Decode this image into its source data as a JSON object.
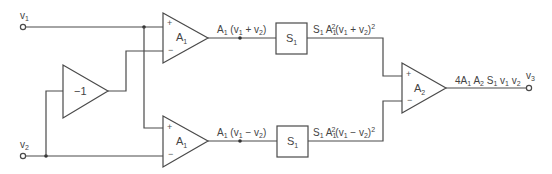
{
  "diagram": {
    "type": "analog multiplier circuit (quarter-square)",
    "terminals": {
      "v1": {
        "label": "v",
        "sub": "1"
      },
      "v2": {
        "label": "v",
        "sub": "2"
      },
      "v3": {
        "label": "v",
        "sub": "3"
      }
    },
    "blocks": {
      "inverter": {
        "label": "−1"
      },
      "amp_top": {
        "label": "A",
        "sub": "1",
        "plus": "+",
        "minus": "−"
      },
      "amp_bottom": {
        "label": "A",
        "sub": "1",
        "plus": "+",
        "minus": "−"
      },
      "square_top": {
        "label": "S",
        "sub": "1"
      },
      "square_bottom": {
        "label": "S",
        "sub": "1"
      },
      "amp_out": {
        "label": "A",
        "sub": "2",
        "plus": "+",
        "minus": "−"
      }
    },
    "signals": {
      "top_amp_out": "A1(v1 + v2)",
      "bottom_amp_out": "A1(v1 − v2)",
      "top_square_out": "S1 A1^2 (v1 + v2)^2",
      "bottom_square_out": "S1 A1^2 (v1 − v2)^2",
      "final_out": "4A1 A2 S1 v1 v2"
    },
    "text": {
      "v": "v",
      "A": "A",
      "S": "S",
      "one": "1",
      "two": "2",
      "three": "3",
      "four": "4",
      "plus_op": " + ",
      "minus_op": " − ",
      "lp": "(",
      "rp": ")"
    }
  }
}
